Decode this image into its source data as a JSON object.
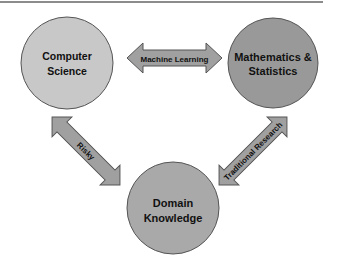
{
  "diagram": {
    "type": "venn-triangle-relationship",
    "nodes": [
      {
        "id": "cs",
        "label_lines": [
          "Computer",
          "Science"
        ],
        "color": "#c8c8c8"
      },
      {
        "id": "math",
        "label_lines": [
          "Mathematics &",
          "Statistics"
        ],
        "color": "#999999"
      },
      {
        "id": "domain",
        "label_lines": [
          "Domain",
          "Knowledge"
        ],
        "color": "#a9a9a9"
      }
    ],
    "edges": [
      {
        "from": "cs",
        "to": "math",
        "label": "Machine Learning",
        "direction": "bidirectional"
      },
      {
        "from": "cs",
        "to": "domain",
        "label": "Risky",
        "direction": "bidirectional"
      },
      {
        "from": "math",
        "to": "domain",
        "label": "Traditional Research",
        "direction": "bidirectional"
      }
    ],
    "arrow_color": "#a0a0a0",
    "outline_color": "#555555"
  }
}
